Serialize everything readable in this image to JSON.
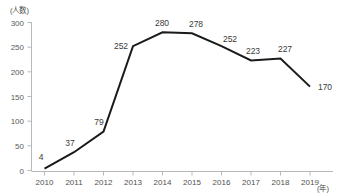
{
  "chart_data": {
    "type": "line",
    "title": "",
    "xlabel": "(年)",
    "ylabel": "(人数)",
    "categories": [
      "2010",
      "2011",
      "2012",
      "2013",
      "2014",
      "2015",
      "2016",
      "2017",
      "2018",
      "2019"
    ],
    "values": [
      4,
      37,
      79,
      252,
      280,
      278,
      252,
      223,
      227,
      170
    ],
    "series": [
      {
        "name": "人数",
        "values": [
          4,
          37,
          79,
          252,
          280,
          278,
          252,
          223,
          227,
          170
        ]
      }
    ],
    "ylim": [
      0,
      300
    ],
    "yticks": [
      0,
      50,
      100,
      150,
      200,
      250,
      300
    ],
    "ytick_labels": [
      "0",
      "50",
      "100",
      "150",
      "200",
      "250",
      "300"
    ],
    "grid": false,
    "legend": "none",
    "line_color": "#1a1a1a",
    "axis_color": "#b9b9b9",
    "label_color": "#3a3a3a",
    "data_labels": [
      "4",
      "37",
      "79",
      "252",
      "280",
      "278",
      "252",
      "223",
      "227",
      "170"
    ]
  },
  "axes": {
    "y_axis_caption": "(人数)",
    "x_axis_caption": "(年)"
  }
}
